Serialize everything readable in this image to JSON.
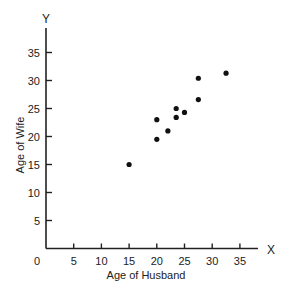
{
  "chart_data": {
    "type": "scatter",
    "title": "",
    "xlabel": "Age of Husband",
    "ylabel": "Age of Wife",
    "x_axis_letter": "X",
    "y_axis_letter": "Y",
    "xlim": [
      0,
      38
    ],
    "ylim": [
      0,
      39
    ],
    "x_ticks": [
      5,
      10,
      15,
      20,
      25,
      30,
      35
    ],
    "y_ticks": [
      5,
      10,
      15,
      20,
      25,
      30,
      35
    ],
    "origin_label": "0",
    "grid": false,
    "legend": null,
    "series": [
      {
        "name": "Couples",
        "points": [
          {
            "x": 15,
            "y": 15
          },
          {
            "x": 20,
            "y": 19.5
          },
          {
            "x": 20,
            "y": 23
          },
          {
            "x": 22,
            "y": 21
          },
          {
            "x": 23.5,
            "y": 23.4
          },
          {
            "x": 23.5,
            "y": 25
          },
          {
            "x": 25,
            "y": 24.3
          },
          {
            "x": 27.5,
            "y": 26.6
          },
          {
            "x": 27.5,
            "y": 30.4
          },
          {
            "x": 32.5,
            "y": 31.3
          }
        ]
      }
    ],
    "colors": {
      "axis": "#222222",
      "point": "#111111",
      "background": "#ffffff"
    }
  }
}
